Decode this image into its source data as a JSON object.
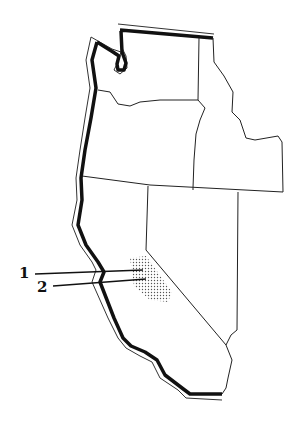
{
  "map": {
    "title": "",
    "region": "Western United States",
    "states": [
      "Washington",
      "Oregon",
      "Idaho",
      "California",
      "Nevada"
    ],
    "shaded_region": "stippled-area",
    "labels": [
      {
        "id": "1",
        "text": "1"
      },
      {
        "id": "2",
        "text": "2"
      }
    ],
    "colors": {
      "outline": "#111111",
      "background": "#ffffff",
      "stipple": "#555555"
    }
  }
}
